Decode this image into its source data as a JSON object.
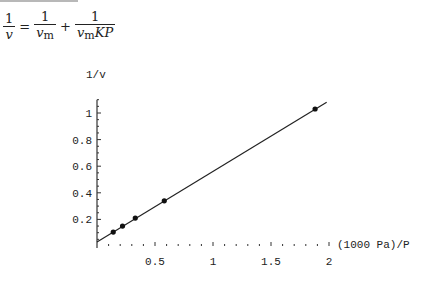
{
  "equation": {
    "lhs_num": "1",
    "lhs_den_var": "v",
    "equals": "=",
    "t1_num": "1",
    "t1_den_var": "v",
    "t1_den_sub": "m",
    "plus": "+",
    "t2_num": "1",
    "t2_den_var": "v",
    "t2_den_sub": "m",
    "t2_den_rest": "KP"
  },
  "chart_data": {
    "type": "scatter",
    "title": "",
    "xlabel": "(1000 Pa)/P",
    "ylabel": "1/v",
    "xlim": [
      0,
      2.05
    ],
    "ylim": [
      0,
      1.1
    ],
    "x_ticks": [
      0.5,
      1,
      1.5,
      2
    ],
    "x_tick_labels": [
      "0.5",
      "1",
      "1.5",
      "2"
    ],
    "y_ticks": [
      0.2,
      0.4,
      0.6,
      0.8,
      1
    ],
    "y_tick_labels": [
      "0.2",
      "0.4",
      "0.6",
      "0.8",
      "1"
    ],
    "grid": false,
    "legend": null,
    "series": [
      {
        "name": "data",
        "type": "scatter",
        "x": [
          0.14,
          0.22,
          0.33,
          0.58,
          1.88
        ],
        "y": [
          0.105,
          0.15,
          0.21,
          0.34,
          1.03
        ]
      },
      {
        "name": "linear fit",
        "type": "line",
        "x": [
          0,
          1.98
        ],
        "y": [
          0.03,
          1.08
        ]
      }
    ]
  }
}
